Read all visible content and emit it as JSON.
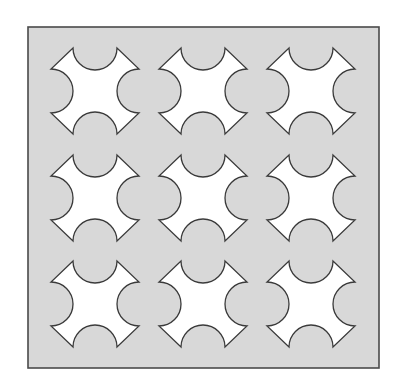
{
  "figure": {
    "panel": {
      "x": 28,
      "y": 27,
      "width": 351,
      "height": 341,
      "fill": "#d8d8d8",
      "stroke": "#4a4a4a",
      "stroke_width": 1.6
    },
    "tile": {
      "width": 88,
      "height": 86,
      "bite_radius": 22,
      "fill": "#ffffff",
      "stroke": "#3a3a3a",
      "stroke_width": 1.3
    },
    "grid": {
      "rows": 3,
      "columns": 3,
      "column_origins": [
        51,
        159,
        267
      ],
      "row_origins": [
        48,
        155,
        261
      ]
    }
  }
}
